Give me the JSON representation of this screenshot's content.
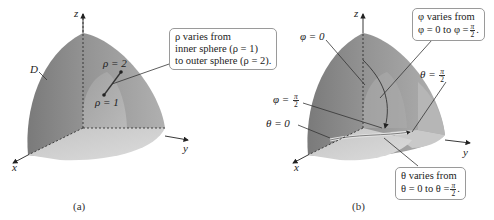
{
  "panels": [
    {
      "id": "a",
      "caption": "(a)",
      "axes": {
        "x": "x",
        "y": "y",
        "z": "z"
      },
      "region_label": "D",
      "labels": {
        "rho_outer": "ρ = 2",
        "rho_inner": "ρ = 1"
      },
      "callout": {
        "line1": "ρ varies from",
        "line2": "inner sphere (ρ = 1)",
        "line3": "to outer sphere (ρ = 2)."
      }
    },
    {
      "id": "b",
      "caption": "(b)",
      "axes": {
        "x": "x",
        "y": "y",
        "z": "z"
      },
      "labels": {
        "phi_zero": "φ = 0",
        "phi_half_pi_prefix": "φ =",
        "theta_zero": "θ = 0",
        "theta_half_pi_prefix": "θ ="
      },
      "fraction": {
        "numerator": "π",
        "denominator": "2"
      },
      "callout_phi": {
        "line1": "φ varies from",
        "line2_prefix": "φ = 0 to φ =",
        "line2_suffix": "."
      },
      "callout_theta": {
        "line1": "θ varies from",
        "line2_prefix": "θ = 0 to θ =",
        "line2_suffix": "."
      }
    }
  ],
  "colors": {
    "outer_shell": "#8c8c8c",
    "outer_shell_light": "#a8a8a8",
    "inner_shell": "#b4b4b4",
    "base": "#cfcfcf",
    "cut_face": "#c2c2c2",
    "axis": "#222222",
    "callout_border": "#9a9a9a"
  }
}
